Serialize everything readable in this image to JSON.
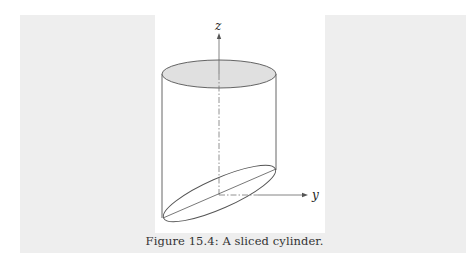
{
  "figure": {
    "axes": {
      "z_label": "z",
      "y_label": "y"
    },
    "shape": "sliced-cylinder",
    "colors": {
      "top_face_fill": "#e0e0e0",
      "stroke": "#555555",
      "axis": "#666666",
      "background_panel": "#eeeeee",
      "figure_background": "#ffffff"
    }
  },
  "caption": {
    "text": "Figure 15.4: A sliced cylinder."
  }
}
